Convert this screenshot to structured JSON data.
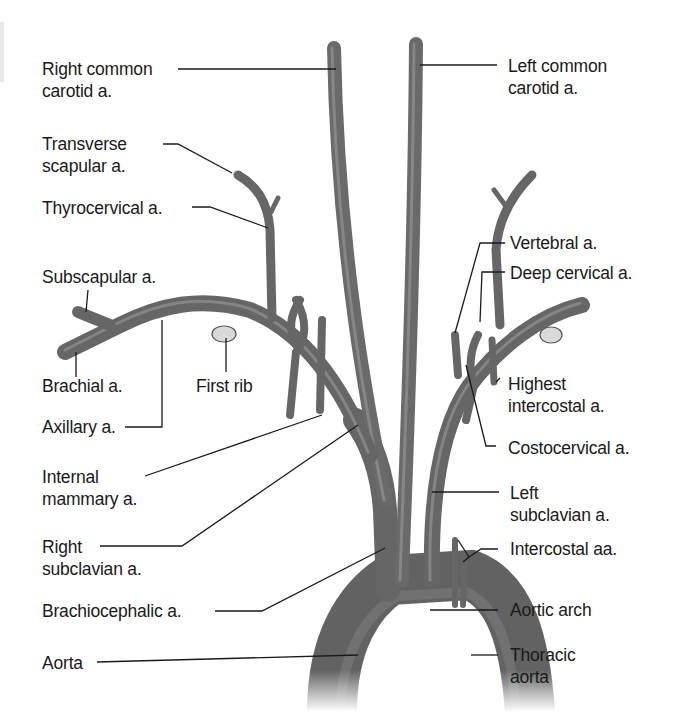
{
  "figure": {
    "colors": {
      "vessel": "#6e6e6e",
      "vessel_dark": "#4a4a4a",
      "vessel_light": "#9a9a9a",
      "rib": "#d9d9d9",
      "leader": "#1a1a1a",
      "text": "#1a1a1a",
      "background": "#ffffff"
    }
  },
  "labels": {
    "right_common_carotid": [
      "Right common",
      "carotid a."
    ],
    "left_common_carotid": [
      "Left common",
      "carotid a."
    ],
    "transverse_scapular": [
      "Transverse",
      "scapular a."
    ],
    "thyrocervical": "Thyrocervical a.",
    "vertebral": "Vertebral a.",
    "deep_cervical": "Deep cervical a.",
    "subscapular": "Subscapular a.",
    "brachial": "Brachial a.",
    "first_rib": "First rib",
    "highest_intercostal": [
      "Highest",
      "intercostal a."
    ],
    "axillary": "Axillary a.",
    "costocervical": "Costocervical a.",
    "internal_mammary": [
      "Internal",
      "mammary a."
    ],
    "left_subclavian": [
      "Left",
      "subclavian a."
    ],
    "right_subclavian": [
      "Right",
      "subclavian a."
    ],
    "intercostal": "Intercostal aa.",
    "brachiocephalic": "Brachiocephalic a.",
    "aortic_arch": "Aortic arch",
    "aorta": "Aorta",
    "thoracic_aorta": [
      "Thoracic",
      "aorta"
    ]
  }
}
